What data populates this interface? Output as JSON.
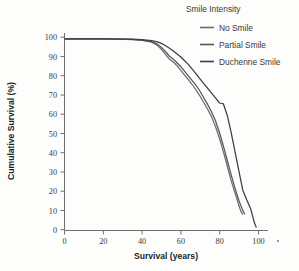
{
  "chart_data": {
    "type": "line",
    "title": "",
    "xlabel": "Survival (years)",
    "ylabel": "Cumulative Survival (%)",
    "xlim": [
      0,
      105
    ],
    "ylim": [
      0,
      103
    ],
    "xticks": [
      0,
      20,
      40,
      60,
      80,
      100
    ],
    "yticks": [
      0,
      10,
      20,
      30,
      40,
      50,
      60,
      70,
      80,
      90,
      100
    ],
    "grid": false,
    "legend_title": "Smile Intensity",
    "legend_position": "top-right",
    "series": [
      {
        "name": "No Smile",
        "color": "#6b6b6b",
        "x": [
          0,
          20,
          35,
          40,
          45,
          48,
          50,
          52,
          54,
          56,
          58,
          60,
          62,
          64,
          66,
          68,
          70,
          72,
          74,
          76,
          78,
          80,
          82,
          84,
          86,
          88,
          90,
          91,
          92
        ],
        "y": [
          100,
          100,
          99.6,
          99.2,
          98.2,
          96.5,
          94.5,
          92.0,
          89.5,
          88.0,
          86.0,
          83.5,
          81.0,
          78.5,
          76.0,
          73.0,
          70.0,
          66.5,
          63.0,
          59.0,
          54.0,
          48.0,
          41.0,
          33.5,
          26.0,
          19.5,
          13.0,
          10.0,
          8.2
        ]
      },
      {
        "name": "Partial Smile",
        "color": "#555555",
        "x": [
          0,
          20,
          35,
          40,
          45,
          48,
          50,
          52,
          54,
          56,
          58,
          60,
          62,
          64,
          66,
          68,
          70,
          72,
          74,
          76,
          78,
          80,
          82,
          84,
          86,
          88,
          90,
          92,
          93
        ],
        "y": [
          100,
          100,
          99.7,
          99.3,
          98.5,
          97.2,
          95.5,
          93.5,
          91.0,
          89.5,
          87.5,
          85.5,
          83.0,
          80.5,
          78.0,
          75.5,
          72.5,
          69.0,
          65.5,
          61.5,
          57.0,
          51.0,
          44.0,
          36.5,
          29.0,
          22.0,
          15.5,
          10.5,
          8.5
        ]
      },
      {
        "name": "Duchenne Smile",
        "color": "#3f3f3f",
        "x": [
          0,
          20,
          35,
          40,
          45,
          48,
          50,
          52,
          54,
          56,
          58,
          60,
          62,
          64,
          66,
          68,
          70,
          72,
          74,
          76,
          78,
          80,
          82,
          84,
          86,
          88,
          90,
          92,
          94,
          96,
          98,
          99
        ],
        "y": [
          100,
          100,
          99.8,
          99.5,
          99.0,
          98.4,
          97.6,
          96.5,
          95.2,
          93.8,
          92.2,
          90.5,
          88.5,
          86.5,
          84.0,
          81.5,
          79.0,
          76.5,
          74.0,
          71.5,
          69.0,
          66.5,
          66.0,
          60.0,
          51.0,
          41.0,
          31.0,
          21.0,
          16.0,
          11.5,
          4.0,
          1.5
        ]
      }
    ],
    "annotations": []
  },
  "legend": {
    "title": "Smile Intensity",
    "items": [
      {
        "label": "No Smile",
        "color": "#6b6b6b"
      },
      {
        "label": "Partial Smile",
        "color": "#555555"
      },
      {
        "label": "Duchenne Smile",
        "color": "#3f3f3f"
      }
    ]
  },
  "axes": {
    "x_title": "Survival (years)",
    "y_title": "Cumulative Survival (%)",
    "x_tick_labels": [
      "0",
      "20",
      "40",
      "60",
      "80",
      "100"
    ],
    "y_tick_labels": [
      "0",
      "10",
      "20",
      "30",
      "40",
      "50",
      "60",
      "70",
      "80",
      "90",
      "100"
    ]
  },
  "colors": {
    "background": "#fdfdfc",
    "axis": "#6f6f6f",
    "text": "#3a3a3a"
  }
}
